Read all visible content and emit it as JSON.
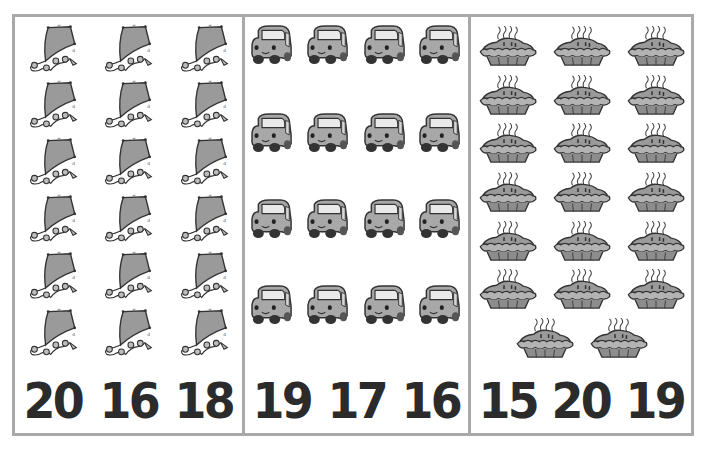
{
  "worksheet": {
    "type": "count-and-circle",
    "panels": [
      {
        "id": "kites",
        "object": "kite-icon",
        "count": 18,
        "layout": {
          "columns": 3,
          "rows": 6
        },
        "choices": [
          "20",
          "16",
          "18"
        ]
      },
      {
        "id": "cars",
        "object": "car-icon",
        "count": 16,
        "layout": {
          "columns": 4,
          "rows": 4
        },
        "choices": [
          "19",
          "17",
          "16"
        ]
      },
      {
        "id": "pies",
        "object": "pie-icon",
        "count": 20,
        "layout": {
          "columns": 3,
          "rows": 6,
          "extra_row": 2
        },
        "choices": [
          "15",
          "20",
          "19"
        ]
      }
    ]
  },
  "colors": {
    "border": "#a9a9a9",
    "icon_fill": "#9a9a9a",
    "icon_stroke": "#333333",
    "numeral": "#2b2b2b"
  }
}
